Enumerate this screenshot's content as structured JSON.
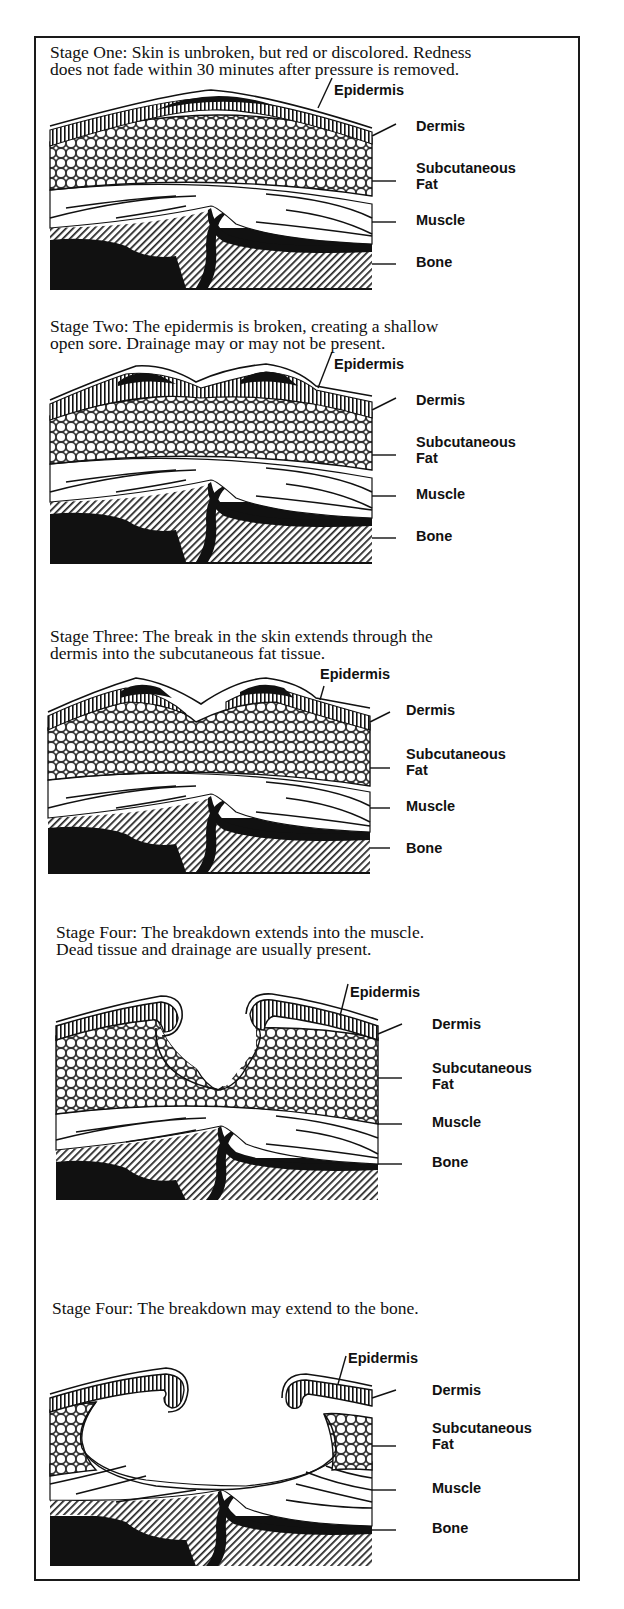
{
  "stages": [
    {
      "caption": "Stage One: Skin is unbroken, but red or discolored. Redness\ndoes not fade within 30 minutes after pressure is removed.",
      "labels": {
        "epidermis": "Epidermis",
        "dermis": "Dermis",
        "fat": "Subcutaneous\nFat",
        "muscle": "Muscle",
        "bone": "Bone"
      }
    },
    {
      "caption": "Stage Two: The epidermis is broken, creating a shallow\nopen sore. Drainage may or may not be present.",
      "labels": {
        "epidermis": "Epidermis",
        "dermis": "Dermis",
        "fat": "Subcutaneous\nFat",
        "muscle": "Muscle",
        "bone": "Bone"
      }
    },
    {
      "caption": "Stage Three: The break in the skin extends through the\ndermis into the subcutaneous fat tissue.",
      "labels": {
        "epidermis": "Epidermis",
        "dermis": "Dermis",
        "fat": "Subcutaneous\nFat",
        "muscle": "Muscle",
        "bone": "Bone"
      }
    },
    {
      "caption": "Stage Four: The breakdown extends into the muscle.\nDead tissue and drainage are usually present.",
      "labels": {
        "epidermis": "Epidermis",
        "dermis": "Dermis",
        "fat": "Subcutaneous\nFat",
        "muscle": "Muscle",
        "bone": "Bone"
      }
    },
    {
      "caption": "Stage Four: The breakdown may extend to the bone.",
      "labels": {
        "epidermis": "Epidermis",
        "dermis": "Dermis",
        "fat": "Subcutaneous\nFat",
        "muscle": "Muscle",
        "bone": "Bone"
      }
    }
  ]
}
